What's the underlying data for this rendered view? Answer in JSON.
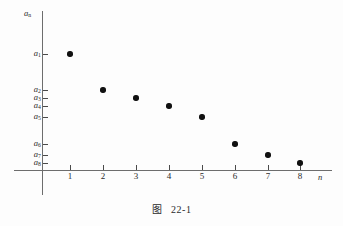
{
  "figure": {
    "caption_label": "图",
    "caption_number": "22-1"
  },
  "chart_data": {
    "type": "scatter",
    "xlabel": "n",
    "ylabel": "a_n",
    "grid": false,
    "legend": null,
    "x": [
      1,
      2,
      3,
      4,
      5,
      6,
      7,
      8
    ],
    "x_tick_labels": [
      "1",
      "2",
      "3",
      "4",
      "5",
      "6",
      "7",
      "8"
    ],
    "y_tick_labels": [
      "a1",
      "a2",
      "a3",
      "a4",
      "a5",
      "a6",
      "a7",
      "a8"
    ],
    "series": [
      {
        "name": "a_n",
        "points": [
          {
            "n": 1,
            "label": "a1",
            "y_px": 54
          },
          {
            "n": 2,
            "label": "a2",
            "y_px": 90
          },
          {
            "n": 3,
            "label": "a3",
            "y_px": 98
          },
          {
            "n": 4,
            "label": "a4",
            "y_px": 106
          },
          {
            "n": 5,
            "label": "a5",
            "y_px": 117
          },
          {
            "n": 6,
            "label": "a6",
            "y_px": 144
          },
          {
            "n": 7,
            "label": "a7",
            "y_px": 155
          },
          {
            "n": 8,
            "label": "a8",
            "y_px": 163
          }
        ]
      }
    ]
  },
  "axes": {
    "y_axis_name": "a",
    "y_axis_name_sub": "n",
    "x_axis_name": "n",
    "y_labels": [
      {
        "base": "a",
        "sub": "1",
        "top": 54
      },
      {
        "base": "a",
        "sub": "2",
        "top": 90
      },
      {
        "base": "a",
        "sub": "3",
        "top": 98
      },
      {
        "base": "a",
        "sub": "4",
        "top": 106
      },
      {
        "base": "a",
        "sub": "5",
        "top": 117
      },
      {
        "base": "a",
        "sub": "6",
        "top": 144
      },
      {
        "base": "a",
        "sub": "7",
        "top": 155
      },
      {
        "base": "a",
        "sub": "8",
        "top": 163
      }
    ],
    "x_labels": [
      {
        "text": "1",
        "left": 70
      },
      {
        "text": "2",
        "left": 103
      },
      {
        "text": "3",
        "left": 136
      },
      {
        "text": "4",
        "left": 169
      },
      {
        "text": "5",
        "left": 202
      },
      {
        "text": "6",
        "left": 235
      },
      {
        "text": "7",
        "left": 268
      },
      {
        "text": "8",
        "left": 300
      }
    ]
  },
  "colors": {
    "axis": "#6d6d6d",
    "point": "#111111",
    "text": "#2b2b2b",
    "background": "#fdfdfd"
  }
}
